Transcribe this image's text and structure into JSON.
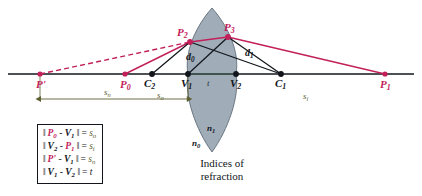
{
  "figure": {
    "colors": {
      "ray": "#c3205a",
      "construction": "#12161c",
      "axis": "#12161c",
      "lens_fill": "#8b9aa8",
      "dimension": "#5d5f33"
    },
    "axis_points": [
      {
        "id": "P-prime",
        "label": "P'",
        "sub": "",
        "color": "red",
        "x": 40,
        "y": 74
      },
      {
        "id": "P0",
        "label": "P",
        "sub": "0",
        "color": "red",
        "x": 125,
        "y": 74
      },
      {
        "id": "C2",
        "label": "C",
        "sub": "2",
        "color": "black",
        "x": 152,
        "y": 74
      },
      {
        "id": "V1",
        "label": "V",
        "sub": "1",
        "color": "black",
        "x": 188,
        "y": 74
      },
      {
        "id": "V2",
        "label": "V",
        "sub": "2",
        "color": "black",
        "x": 236,
        "y": 74
      },
      {
        "id": "C1",
        "label": "C",
        "sub": "1",
        "color": "black",
        "x": 281,
        "y": 74
      },
      {
        "id": "P1",
        "label": "P",
        "sub": "1",
        "color": "red",
        "x": 385,
        "y": 74
      }
    ],
    "surface_points": [
      {
        "id": "P2",
        "label": "P",
        "sub": "2",
        "color": "red",
        "x": 190,
        "y": 42
      },
      {
        "id": "P3",
        "label": "P",
        "sub": "3",
        "color": "red",
        "x": 228,
        "y": 37
      }
    ],
    "distance_labels": [
      {
        "id": "d0",
        "label": "d",
        "sub": "0",
        "x": 192,
        "y": 57
      },
      {
        "id": "d1",
        "label": "d",
        "sub": "1",
        "x": 249,
        "y": 53
      }
    ],
    "dimension_labels": [
      {
        "id": "s-n",
        "label": "s",
        "sub": "n",
        "x": 108,
        "y": 86
      },
      {
        "id": "s-o",
        "label": "s",
        "sub": "o",
        "x": 160,
        "y": 88
      },
      {
        "id": "s-i",
        "label": "s",
        "sub": "i",
        "x": 306,
        "y": 89
      }
    ],
    "index_labels": [
      {
        "id": "n0",
        "label": "n",
        "sub": "0",
        "x": 196,
        "y": 143
      },
      {
        "id": "n1",
        "label": "n",
        "sub": "1",
        "x": 210,
        "y": 128
      }
    ],
    "thickness_label": {
      "id": "t",
      "label": "t",
      "x": 209,
      "y": 78
    },
    "caption": {
      "line1": "Indices of",
      "line2": "refraction"
    }
  },
  "legend": {
    "rows": [
      {
        "id": "row-so",
        "open": "‖",
        "term1": "P",
        "term1_sub": "0",
        "term1_color": "red",
        "minus": "-",
        "term2": "V",
        "term2_sub": "1",
        "term2_color": "black",
        "close": "‖",
        "equals": "=",
        "result": "s",
        "result_sub": "o",
        "result_color": "olive"
      },
      {
        "id": "row-si",
        "open": "‖",
        "term1": "V",
        "term1_sub": "2",
        "term1_color": "black",
        "minus": "-",
        "term2": "P",
        "term2_sub": "1",
        "term2_color": "red",
        "close": "‖",
        "equals": "=",
        "result": "s",
        "result_sub": "i",
        "result_color": "olive"
      },
      {
        "id": "row-sn",
        "open": "‖",
        "term1": "P'",
        "term1_sub": "",
        "term1_color": "red",
        "minus": "-",
        "term2": "V",
        "term2_sub": "1",
        "term2_color": "black",
        "close": "‖",
        "equals": "=",
        "result": "s",
        "result_sub": "n",
        "result_color": "olive"
      },
      {
        "id": "row-t",
        "open": "‖",
        "term1": "V",
        "term1_sub": "1",
        "term1_color": "black",
        "minus": "-",
        "term2": "V",
        "term2_sub": "2",
        "term2_color": "black",
        "close": "‖",
        "equals": "=",
        "result": "t",
        "result_sub": "",
        "result_color": "black"
      }
    ]
  }
}
